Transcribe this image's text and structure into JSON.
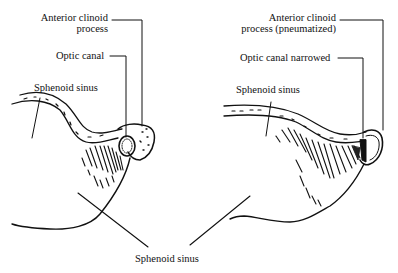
{
  "figure": {
    "left_panel": {
      "title": "Normal (non-pneumatized) anterior clinoid process",
      "labels": {
        "anterior_clinoid_line1": "Anterior clinoid",
        "anterior_clinoid_line2": "process",
        "optic_canal": "Optic canal",
        "sphenoid_sinus": "Sphenoid sinus"
      }
    },
    "right_panel": {
      "title": "Pneumatized anterior clinoid process",
      "labels": {
        "anterior_clinoid_line1": "Anterior clinoid",
        "anterior_clinoid_line2": "process (pneumatized)",
        "optic_canal": "Optic canal narrowed",
        "sphenoid_sinus": "Sphenoid sinus"
      }
    },
    "shared_label": "Sphenoid sinus",
    "colors": {
      "ink": "#111111",
      "background": "#ffffff"
    }
  }
}
